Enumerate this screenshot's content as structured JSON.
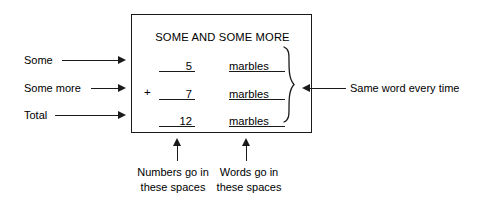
{
  "diagram": {
    "title": "SOME AND SOME MORE",
    "box": {
      "title": "SOME AND SOME MORE",
      "rows": [
        {
          "operator": "",
          "number": "5",
          "word": "marbles"
        },
        {
          "operator": "+",
          "number": "7",
          "word": "marbles"
        },
        {
          "operator": "",
          "number": "12",
          "word": "marbles"
        }
      ]
    },
    "left_labels": [
      {
        "text": "Some"
      },
      {
        "text": "Some more"
      },
      {
        "text": "Total"
      }
    ],
    "right_annotation": {
      "text": "Same word every time"
    },
    "bottom_annotations": [
      {
        "line1": "Numbers go in",
        "line2": "these spaces"
      },
      {
        "line1": "Words go in",
        "line2": "these spaces"
      }
    ],
    "colors": {
      "ink": "#1a1a1a",
      "background": "#ffffff"
    }
  }
}
